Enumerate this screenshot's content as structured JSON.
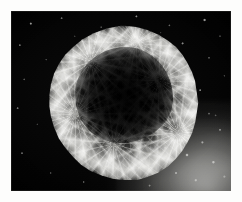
{
  "figure": {
    "domain": "Natural-Image",
    "medium": "halftone-printed black-and-white astronomical photograph",
    "caption": "",
    "width_px": 242,
    "height_px": 202
  },
  "page": {
    "background_color": "#fdfdfc",
    "margin_left_px": 11,
    "margin_top_px": 11,
    "margin_right_px": 11,
    "margin_bottom_px": 11
  },
  "plate": {
    "label": "photographic plate",
    "left_px": 11,
    "top_px": 11,
    "width_px": 220,
    "height_px": 180,
    "background_color": "#0a0a0a",
    "edge_color": "#787876"
  },
  "sky": {
    "label": "dark sky background",
    "color": "#0b0b0b",
    "star_count_visible": 24,
    "star_color": "#e1e1de"
  },
  "nebula": {
    "label": "filamentary bubble nebula",
    "shape": "irregular near-circular shell",
    "center_x_pct": 52,
    "center_y_pct": 51,
    "width_pct": 72,
    "height_pct": 86,
    "rim_color": "#cdcdc8",
    "cavity_color": "#060606",
    "filament_color": "#dcdcd7",
    "brightest_region": "right and upper-left rim",
    "darkest_region": "central cavity"
  },
  "glow": {
    "label": "diffuse bright glow",
    "position": "lower-right corner",
    "color": "#cdcdc8",
    "star_count_visible": 10
  },
  "texture": {
    "label": "print halftone grain",
    "opacity": 0.7
  }
}
